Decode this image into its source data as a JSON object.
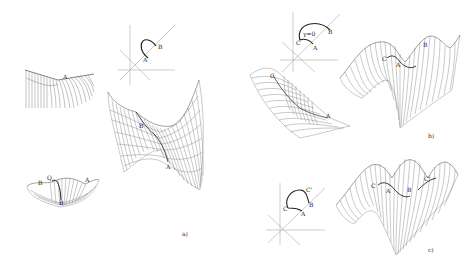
{
  "figure": {
    "panels": [
      {
        "id": "a",
        "caption": "a)",
        "point_labels": [
          "A",
          "B",
          "Q",
          "A",
          "B",
          "A"
        ]
      },
      {
        "id": "b",
        "caption": "b)",
        "point_labels": [
          "A",
          "B",
          "C",
          "γ=0",
          "C",
          "A",
          "B"
        ]
      },
      {
        "id": "c",
        "caption": "c)",
        "point_labels": [
          "A",
          "B",
          "C",
          "C'",
          "C",
          "A",
          "B",
          "C'"
        ]
      }
    ],
    "labels": {
      "a_inset_A": "A",
      "a_inset_B": "B",
      "a_small_A": "A",
      "a_bottom_B": "B",
      "a_bottom_Q": "Q",
      "a_bottom_A": "A",
      "a_main_B": "B",
      "a_main_A": "A",
      "b_inset_gamma": "γ=0",
      "b_inset_C": "C",
      "b_inset_A": "A",
      "b_inset_B": "B",
      "b_left_C": "C",
      "b_left_A": "A",
      "b_main_C": "C",
      "b_main_A": "A",
      "b_main_B": "B",
      "c_inset_C": "C",
      "c_inset_A": "A",
      "c_inset_B": "B",
      "c_inset_Cp": "C'",
      "c_main_C": "C",
      "c_main_A": "A",
      "c_main_B": "B",
      "c_main_Cp": "C'",
      "cap_a": "a)",
      "cap_b": "b)",
      "cap_c": "c)"
    }
  }
}
